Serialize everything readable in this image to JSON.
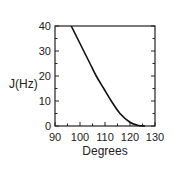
{
  "chart_data": {
    "type": "line",
    "title": "",
    "xlabel": "Degrees",
    "ylabel": "J(Hz)",
    "xlim": [
      90,
      130
    ],
    "ylim": [
      0,
      40
    ],
    "xticks": [
      90,
      100,
      110,
      120,
      130
    ],
    "yticks": [
      0,
      10,
      20,
      30,
      40
    ],
    "grid": false,
    "legend": null,
    "series": [
      {
        "name": "J",
        "color": "#111111",
        "x": [
          96.5,
          99,
          101.5,
          104,
          106.5,
          109.5,
          112.5,
          116,
          120,
          123,
          126
        ],
        "y": [
          40,
          35,
          30,
          25,
          20,
          15,
          10,
          5,
          1.5,
          0.3,
          0
        ]
      }
    ]
  },
  "labels": {
    "x_axis": "Degrees",
    "y_axis": "J(Hz)",
    "x_ticks": [
      "90",
      "100",
      "110",
      "120",
      "130"
    ],
    "y_ticks": [
      "0",
      "10",
      "20",
      "30",
      "40"
    ]
  }
}
